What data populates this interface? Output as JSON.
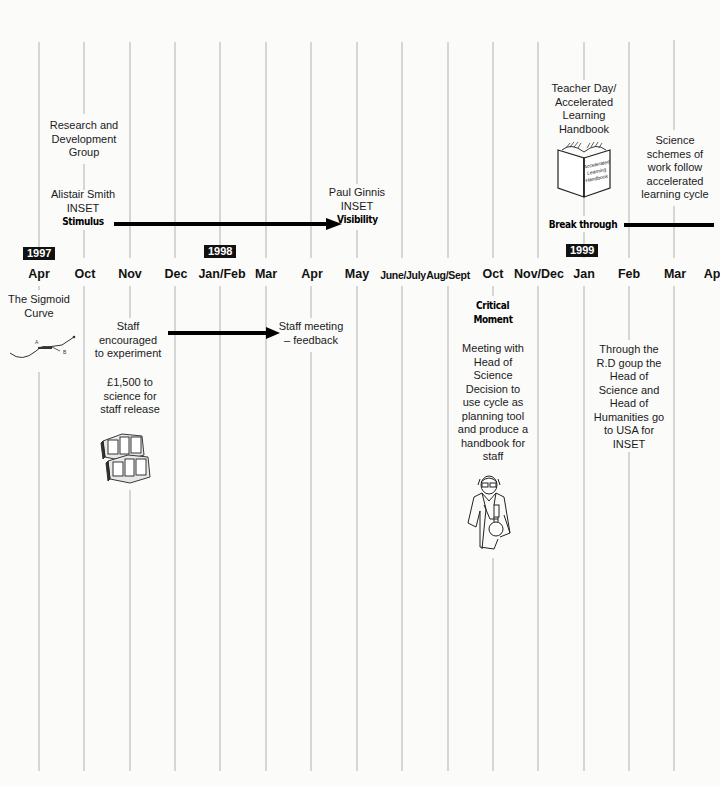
{
  "columns": [
    {
      "label": "Apr",
      "x": 39
    },
    {
      "label": "Oct",
      "x": 84
    },
    {
      "label": "Nov",
      "x": 130
    },
    {
      "label": "Dec",
      "x": 175
    },
    {
      "label": "Jan/Feb",
      "x": 220
    },
    {
      "label": "Mar",
      "x": 266
    },
    {
      "label": "Apr",
      "x": 311
    },
    {
      "label": "May",
      "x": 357
    },
    {
      "label": "June/July",
      "x": 402
    },
    {
      "label": "Aug/Sept",
      "x": 448
    },
    {
      "label": "Oct",
      "x": 493
    },
    {
      "label": "Nov/Dec",
      "x": 538
    },
    {
      "label": "Jan",
      "x": 584
    },
    {
      "label": "Feb",
      "x": 629
    },
    {
      "label": "Mar",
      "x": 674
    },
    {
      "label": "Ap",
      "x": 713
    }
  ],
  "years": [
    {
      "label": "1997"
    },
    {
      "label": "1998"
    },
    {
      "label": "1999"
    }
  ],
  "above": {
    "rd_group": [
      "Research and",
      "Development",
      "Group"
    ],
    "alistair": [
      "Alistair Smith",
      "INSET"
    ],
    "stimulus": "Stimulus",
    "paul": [
      "Paul Ginnis",
      "INSET"
    ],
    "visibility": "Visibility",
    "teacher_day": [
      "Teacher Day/",
      "Accelerated",
      "Learning",
      "Handbook"
    ],
    "handbook_cover": [
      "Accelerated",
      "Learning",
      "Handbook"
    ],
    "science_schemes": [
      "Science",
      "schemes of",
      "work follow",
      "accelerated",
      "learning cycle"
    ],
    "break_through": "Break through"
  },
  "below": {
    "sigmoid": [
      "The Sigmoid",
      "Curve"
    ],
    "sigmoid_points": [
      "A",
      "B"
    ],
    "staff_encouraged": [
      "Staff",
      "encouraged",
      "to experiment"
    ],
    "money": [
      "£1,500 to",
      "science for",
      "staff release"
    ],
    "staff_meeting": [
      "Staff meeting",
      "– feedback"
    ],
    "critical_moment": [
      "Critical",
      "Moment"
    ],
    "meeting_head": [
      "Meeting with",
      "Head of",
      "Science",
      "Decision to",
      "use cycle as",
      "planning tool",
      "and produce a",
      "handbook for",
      "staff"
    ],
    "rd_group_usa": [
      "Through the",
      "R.D goup the",
      "Head of",
      "Science and",
      "Head of",
      "Humanities go",
      "to USA for",
      "INSET"
    ]
  }
}
